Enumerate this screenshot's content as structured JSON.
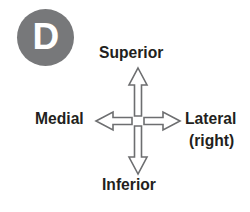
{
  "figure": {
    "panel": {
      "letter": "D",
      "shape": "circle",
      "fill_color": "#77787a",
      "text_color": "#ffffff"
    },
    "diagram": {
      "type": "anatomical-direction-cross",
      "center": {
        "x": 138,
        "y": 121
      },
      "arrow_outline_color": "#6d6e70",
      "arrow_fill_color": "#ffffff",
      "labels": {
        "up": "Superior",
        "down": "Inferior",
        "left": "Medial",
        "right": "Lateral",
        "right_secondary": "(right)"
      },
      "arrows": [
        {
          "name": "superior-arrow",
          "direction": "up"
        },
        {
          "name": "inferior-arrow",
          "direction": "down"
        },
        {
          "name": "medial-arrow",
          "direction": "left"
        },
        {
          "name": "lateral-arrow",
          "direction": "right"
        }
      ]
    },
    "text_color": "#231f20",
    "background_color": "#ffffff"
  }
}
